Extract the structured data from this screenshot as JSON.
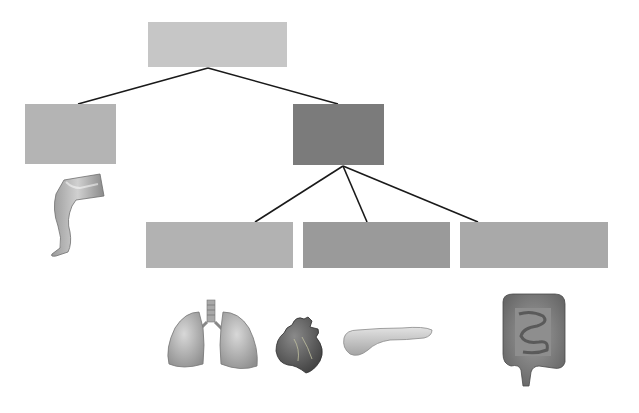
{
  "diagram": {
    "type": "hierarchy-tree",
    "background": "#ffffff",
    "line_color": "#1a1a1a",
    "nodes": [
      {
        "id": "root",
        "label": "",
        "x": 148,
        "y": 22,
        "w": 139,
        "h": 45,
        "color": "#c6c6c6"
      },
      {
        "id": "level1-left",
        "label": "",
        "x": 25,
        "y": 104,
        "w": 91,
        "h": 60,
        "color": "#b4b4b4"
      },
      {
        "id": "level1-right",
        "label": "",
        "x": 293,
        "y": 104,
        "w": 91,
        "h": 61,
        "color": "#7b7b7b"
      },
      {
        "id": "level2-a",
        "label": "",
        "x": 146,
        "y": 222,
        "w": 147,
        "h": 46,
        "color": "#b2b2b2"
      },
      {
        "id": "level2-b",
        "label": "",
        "x": 303,
        "y": 222,
        "w": 147,
        "h": 46,
        "color": "#9a9a9a"
      },
      {
        "id": "level2-c",
        "label": "",
        "x": 460,
        "y": 222,
        "w": 148,
        "h": 46,
        "color": "#a9a9a9"
      }
    ],
    "edges": [
      {
        "from": "root",
        "to": "level1-left",
        "x1": 208,
        "y1": 68,
        "x2": 78,
        "y2": 104
      },
      {
        "from": "root",
        "to": "level1-right",
        "x1": 208,
        "y1": 68,
        "x2": 338,
        "y2": 104
      },
      {
        "from": "level1-right",
        "to": "level2-a",
        "x1": 343,
        "y1": 166,
        "x2": 255,
        "y2": 222
      },
      {
        "from": "level1-right",
        "to": "level2-b",
        "x1": 343,
        "y1": 166,
        "x2": 367,
        "y2": 222
      },
      {
        "from": "level1-right",
        "to": "level2-c",
        "x1": 343,
        "y1": 166,
        "x2": 478,
        "y2": 222
      }
    ],
    "illustrations": [
      {
        "name": "leg",
        "under": "level1-left"
      },
      {
        "name": "lungs",
        "under": "level2-a"
      },
      {
        "name": "heart",
        "under": "level2-a/level2-b"
      },
      {
        "name": "pancreas",
        "under": "level2-b"
      },
      {
        "name": "intestines",
        "under": "level2-c"
      }
    ]
  }
}
